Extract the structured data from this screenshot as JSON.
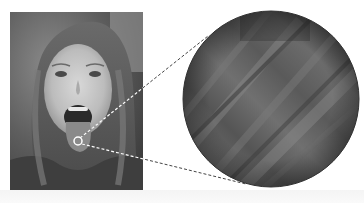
{
  "figure": {
    "photo": {
      "subject": "girl-with-tongue-out",
      "tone": "grayscale",
      "x": 10,
      "y": 12,
      "width": 133,
      "height": 178
    },
    "source_marker": {
      "cx": 78,
      "cy": 141,
      "r": 4,
      "color": "#ffffff"
    },
    "magnified_view": {
      "cx": 271,
      "cy": 99,
      "r": 88,
      "texture": "tongue-surface-closeup",
      "fill": "#5a5a5a",
      "stroke": "#333333"
    },
    "connector_lines": [
      {
        "from": [
          80,
          138
        ],
        "to": [
          208,
          36
        ],
        "style": "dashed"
      },
      {
        "from": [
          82,
          144
        ],
        "to": [
          246,
          184
        ],
        "style": "dashed"
      }
    ],
    "colors": {
      "background": "#ffffff",
      "line_dark": "#444444",
      "line_light": "#ffffff"
    }
  }
}
